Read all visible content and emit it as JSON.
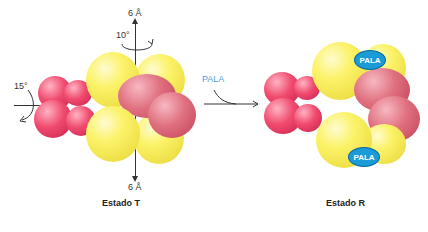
{
  "left_panel": {
    "caption": "Estado T",
    "top_translation": "6 Å",
    "bottom_translation": "6 Å",
    "vertical_rotation": "10°",
    "horizontal_rotation": "15°"
  },
  "transition": {
    "ligand_label": "PALA"
  },
  "right_panel": {
    "caption": "Estado R",
    "ligand_badges": [
      "PALA",
      "PALA"
    ]
  },
  "colors": {
    "catalytic_subunit": "#f5ec5a",
    "regulatory_subunit_front": "#e8405f",
    "regulatory_subunit_back": "#d96a7a",
    "pala_badge": "#1a9bd8",
    "pala_text": "#4a9fd8"
  }
}
